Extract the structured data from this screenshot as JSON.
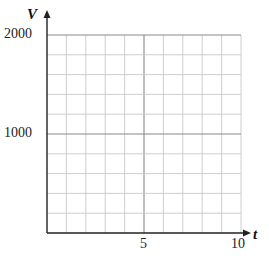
{
  "chart_data": {
    "type": "line",
    "title": "",
    "xlabel": "t",
    "ylabel": "V",
    "xlim": [
      0,
      10
    ],
    "ylim": [
      0,
      2000
    ],
    "x_ticks": [
      5,
      10
    ],
    "x_tick_labels": [
      "5",
      "10"
    ],
    "y_ticks": [
      1000,
      2000
    ],
    "y_tick_labels": [
      "1000",
      "2000"
    ],
    "grid": true,
    "grid_x_step": 1,
    "grid_y_step": 200,
    "series": []
  },
  "labels": {
    "x_axis": "t",
    "y_axis": "V",
    "x_tick_5": "5",
    "x_tick_10": "10",
    "y_tick_1000": "1000",
    "y_tick_2000": "2000"
  },
  "colors": {
    "grid": "#c8c8c8",
    "grid_major": "#8a8a8a",
    "axis": "#222222"
  }
}
